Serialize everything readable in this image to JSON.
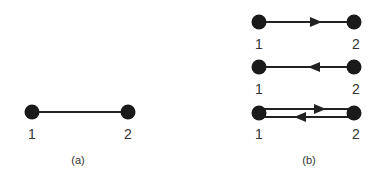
{
  "panels": [
    {
      "caption": "(a)",
      "description": "undirected edge",
      "edges": [
        {
          "from": "1",
          "to": "2",
          "type": "undirected"
        }
      ]
    },
    {
      "caption": "(b)",
      "description": "directed edge variants",
      "edges": [
        {
          "from": "1",
          "to": "2",
          "type": "directed"
        },
        {
          "from": "2",
          "to": "1",
          "type": "directed"
        },
        {
          "from": "1",
          "to": "2",
          "type": "bidirectional-pair"
        }
      ]
    }
  ],
  "labels": {
    "a_node1": "1",
    "a_node2": "2",
    "b1_node1": "1",
    "b1_node2": "2",
    "b2_node1": "1",
    "b2_node2": "2",
    "b3_node1": "1",
    "b3_node2": "2",
    "caption_a": "(a)",
    "caption_b": "(b)"
  },
  "colors": {
    "node": "#1a1a1a",
    "edge": "#222222",
    "text": "#333333"
  }
}
